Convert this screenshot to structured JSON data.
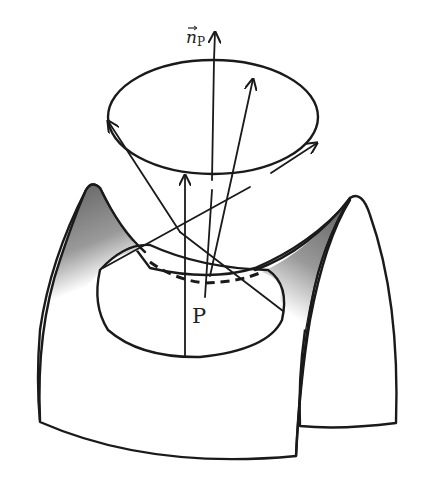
{
  "figure": {
    "type": "saddle surface with normal vector and cone of vectors",
    "labels": {
      "normal_vector": "n",
      "normal_vector_subscript": "P",
      "point": "P"
    },
    "colors": {
      "ink": "#1a1a1a",
      "shading_dark": "#6a6a6a",
      "shading_light": "#ffffff",
      "background": "#ffffff"
    }
  }
}
